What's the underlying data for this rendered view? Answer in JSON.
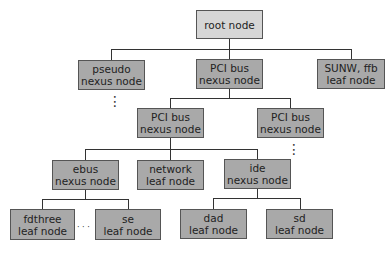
{
  "diagram": {
    "type": "device tree",
    "colors": {
      "root_fill": "#d6d6d6",
      "node_fill": "#a9a9a9",
      "border": "#555555",
      "line": "#333333"
    },
    "nodes": [
      {
        "id": "root",
        "line1": "root node",
        "line2": ""
      },
      {
        "id": "pseudo",
        "line1": "pseudo",
        "line2": "nexus node"
      },
      {
        "id": "pci1",
        "line1": "PCI bus",
        "line2": "nexus node"
      },
      {
        "id": "sunw",
        "line1": "SUNW, ffb",
        "line2": "leaf node"
      },
      {
        "id": "pci2a",
        "line1": "PCI bus",
        "line2": "nexus node"
      },
      {
        "id": "pci2b",
        "line1": "PCI bus",
        "line2": "nexus node"
      },
      {
        "id": "ebus",
        "line1": "ebus",
        "line2": "nexus node"
      },
      {
        "id": "network",
        "line1": "network",
        "line2": "leaf node"
      },
      {
        "id": "ide",
        "line1": "ide",
        "line2": "nexus node"
      },
      {
        "id": "fdthree",
        "line1": "fdthree",
        "line2": "leaf node"
      },
      {
        "id": "se",
        "line1": "se",
        "line2": "leaf node"
      },
      {
        "id": "dad",
        "line1": "dad",
        "line2": "leaf node"
      },
      {
        "id": "sd",
        "line1": "sd",
        "line2": "leaf node"
      }
    ],
    "edges": [
      [
        "root",
        "pseudo"
      ],
      [
        "root",
        "pci1"
      ],
      [
        "root",
        "sunw"
      ],
      [
        "pci1",
        "pci2a"
      ],
      [
        "pci1",
        "pci2b"
      ],
      [
        "pci2a",
        "ebus"
      ],
      [
        "pci2a",
        "network"
      ],
      [
        "pci2a",
        "ide"
      ],
      [
        "ebus",
        "fdthree"
      ],
      [
        "ebus",
        "se"
      ],
      [
        "ide",
        "dad"
      ],
      [
        "ide",
        "sd"
      ]
    ],
    "ellipses": {
      "vertical": "⋮",
      "horizontal": "· · ·"
    }
  }
}
